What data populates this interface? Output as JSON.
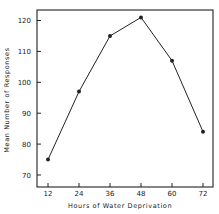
{
  "chart_data": {
    "type": "line",
    "title": "",
    "xlabel": "Hours of Water Deprivation",
    "ylabel": "Mean Number of Responses",
    "x": [
      12,
      24,
      36,
      48,
      60,
      72
    ],
    "series": [
      {
        "name": "Mean Number of Responses",
        "values": [
          75,
          97,
          115,
          121,
          107,
          84
        ]
      }
    ],
    "xticks": [
      "12",
      "24",
      "36",
      "48",
      "60",
      "72"
    ],
    "yticks": [
      "70",
      "80",
      "90",
      "100",
      "110",
      "120"
    ],
    "ylim": [
      67,
      123
    ],
    "xlim": [
      8.5,
      75
    ],
    "grid": false,
    "legend": "none",
    "markers": "filled-circle",
    "colors": {
      "line": "#222222",
      "axis": "#222222"
    }
  }
}
